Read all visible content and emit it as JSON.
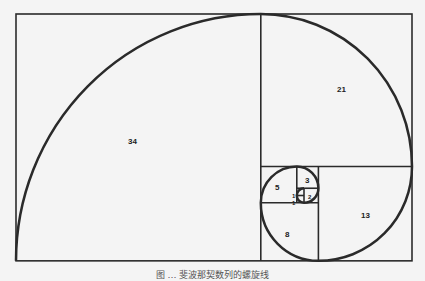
{
  "diagram": {
    "squares": [
      {
        "label": "34"
      },
      {
        "label": "21"
      },
      {
        "label": "13"
      },
      {
        "label": "8"
      },
      {
        "label": "5"
      },
      {
        "label": "3"
      },
      {
        "label": "2"
      },
      {
        "label": "1"
      },
      {
        "label": "1"
      }
    ],
    "caption": "图 … 斐波那契数列的螺旋线"
  }
}
